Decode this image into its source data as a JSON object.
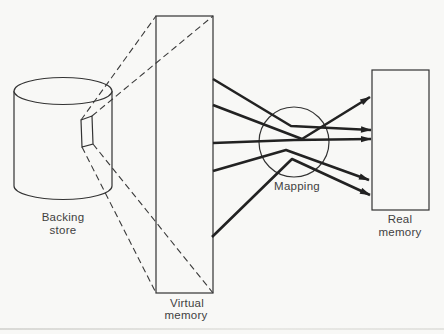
{
  "diagram": {
    "backing_store": {
      "label_line1": "Backing",
      "label_line2": "store"
    },
    "virtual_memory": {
      "label_line1": "Virtual",
      "label_line2": "memory"
    },
    "mapping": {
      "label": "Mapping"
    },
    "real_memory": {
      "label_line1": "Real",
      "label_line2": "memory"
    },
    "mapping_arrow_count": 5,
    "colors": {
      "background": "#f8f8f6",
      "thin_line_ink": "#333333",
      "thick_line_ink": "#222222",
      "text_ink": "#3f3f3f"
    }
  }
}
